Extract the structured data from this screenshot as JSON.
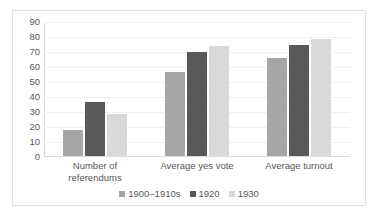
{
  "chart_data": {
    "type": "bar",
    "title": "",
    "subtitle": "",
    "xlabel": "",
    "ylabel": "",
    "categories": [
      "Number of referendums",
      "Average yes vote",
      "Average turnout"
    ],
    "category_lines": [
      [
        "Number of",
        "referendums"
      ],
      [
        "Average yes vote"
      ],
      [
        "Average turnout"
      ]
    ],
    "series": [
      {
        "name": "1900–1910s",
        "values": [
          18,
          57,
          66
        ],
        "color": "#a6a6a6"
      },
      {
        "name": "1920",
        "values": [
          37,
          70,
          75
        ],
        "color": "#595959"
      },
      {
        "name": "1930",
        "values": [
          29,
          74,
          79
        ],
        "color": "#d9d9d9"
      }
    ],
    "ylim": [
      0,
      90
    ],
    "yticks": [
      0,
      10,
      20,
      30,
      40,
      50,
      60,
      70,
      80,
      90
    ],
    "ytick_labels": [
      "0",
      "10",
      "20",
      "30",
      "40",
      "50",
      "60",
      "70",
      "80",
      "90"
    ],
    "grid": true,
    "grid_axis": "y",
    "legend_position": "bottom",
    "plot_background": "#ffffff",
    "grid_color": "#f0f0f0",
    "axis_color": "#d9d9d9",
    "text_color": "#585858",
    "border_color": "#e2e2e4"
  }
}
